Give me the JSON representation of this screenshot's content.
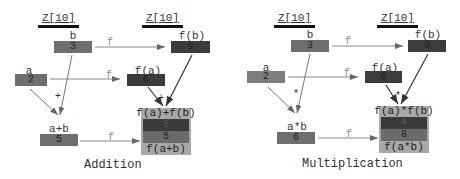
{
  "diagrams": [
    {
      "name": "addition",
      "caption": "Addition",
      "domain_header": "Z[10]",
      "codomain_header": "Z[10]",
      "function_label": "f",
      "operator": "+",
      "nodes": {
        "a": {
          "label": "a",
          "value": "2"
        },
        "b": {
          "label": "b",
          "value": "3"
        },
        "fa": {
          "label": "f(a)",
          "value": "6"
        },
        "fb": {
          "label": "f(b)",
          "value": "9"
        },
        "ab": {
          "label": "a+b",
          "value": "5"
        },
        "result": {
          "top_label": "f(a)+f(b)",
          "value_top": "5",
          "value_bottom": "5",
          "bottom_label": "f(a+b)"
        }
      }
    },
    {
      "name": "multiplication",
      "caption": "Multiplication",
      "domain_header": "Z[10]",
      "codomain_header": "Z[10]",
      "function_label": "f",
      "operator": "*",
      "nodes": {
        "a": {
          "label": "a",
          "value": "2"
        },
        "b": {
          "label": "b",
          "value": "3"
        },
        "fa": {
          "label": "f(a)",
          "value": "6"
        },
        "fb": {
          "label": "f(b)",
          "value": "9"
        },
        "ab": {
          "label": "a*b",
          "value": "6"
        },
        "result": {
          "top_label": "f(a)*f(b)",
          "value_top": "4",
          "value_bottom": "8",
          "bottom_label": "f(a*b)"
        }
      }
    }
  ],
  "colors": {
    "box_input": "#6e6e6e",
    "box_output": "#3c3c3c",
    "result_bg": "#a8a8a8",
    "arrow_f": "#888888",
    "arrow_op": "#555555"
  }
}
